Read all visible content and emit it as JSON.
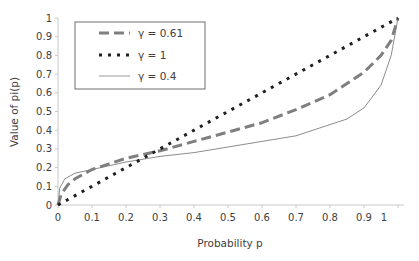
{
  "chart_data": {
    "type": "line",
    "title": "",
    "xlabel": "Probability p",
    "ylabel": "Value of pi(p)",
    "xlim": [
      0,
      1.02
    ],
    "ylim": [
      0,
      1
    ],
    "x_ticks": [
      "0",
      "0.1",
      "0.2",
      "0.3",
      "0.4",
      "0.5",
      "0.6",
      "0.7",
      "0.8",
      "0.9",
      "1"
    ],
    "y_ticks": [
      "0",
      "0.1",
      "0.2",
      "0.3",
      "0.4",
      "0.5",
      "0.6",
      "0.7",
      "0.8",
      "0.9",
      "1"
    ],
    "grid": false,
    "legend_position": "upper-left-inside",
    "series": [
      {
        "name": "γ = 0.61",
        "style": "long-dash",
        "color": "#7f7f7f",
        "x": [
          0,
          0.01,
          0.03,
          0.05,
          0.1,
          0.15,
          0.2,
          0.3,
          0.4,
          0.5,
          0.6,
          0.7,
          0.8,
          0.85,
          0.9,
          0.95,
          0.98,
          1.0
        ],
        "y": [
          0,
          0.06,
          0.11,
          0.14,
          0.19,
          0.22,
          0.25,
          0.29,
          0.34,
          0.39,
          0.44,
          0.51,
          0.59,
          0.65,
          0.71,
          0.8,
          0.88,
          1.0
        ]
      },
      {
        "name": "γ = 1",
        "style": "dotted",
        "color": "#1f1f1f",
        "x": [
          0,
          1.0
        ],
        "y": [
          0,
          1.0
        ]
      },
      {
        "name": "γ = 0.4",
        "style": "solid-thin",
        "color": "#8c8c8c",
        "x": [
          0,
          0.005,
          0.02,
          0.05,
          0.1,
          0.2,
          0.3,
          0.4,
          0.5,
          0.6,
          0.7,
          0.8,
          0.85,
          0.9,
          0.95,
          0.98,
          1.0
        ],
        "y": [
          0,
          0.09,
          0.14,
          0.17,
          0.19,
          0.23,
          0.26,
          0.28,
          0.31,
          0.34,
          0.37,
          0.43,
          0.46,
          0.52,
          0.64,
          0.8,
          1.0
        ]
      }
    ]
  }
}
